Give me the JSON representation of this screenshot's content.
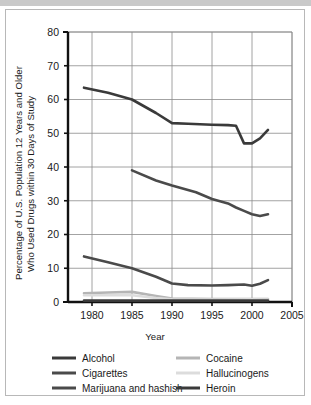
{
  "chart_data": {
    "type": "line",
    "title": "",
    "xlabel": "Year",
    "ylabel": "Percentage of U.S. Population 12 Years and Older Who Used Drugs within 30 Days of Study",
    "ylabel_line1": "Percentage of U.S. Population 12 Years and Older",
    "ylabel_line2": "Who Used Drugs within 30 Days of Study",
    "xlim": [
      1977,
      2005
    ],
    "ylim": [
      0,
      80
    ],
    "xticks": [
      1980,
      1985,
      1990,
      1995,
      2000,
      2005
    ],
    "yticks": [
      0,
      10,
      20,
      30,
      40,
      50,
      60,
      70,
      80
    ],
    "xtick_labels": [
      "1980",
      "1985",
      "1990",
      "1995",
      "2000",
      "2005"
    ],
    "ytick_labels": [
      "0",
      "10",
      "20",
      "30",
      "40",
      "50",
      "60",
      "70",
      "80"
    ],
    "grid": true,
    "legend_position": "below",
    "series": [
      {
        "name": "Alcohol",
        "color": "#3a3a3a",
        "x": [
          1979,
          1982,
          1985,
          1988,
          1990,
          1992,
          1995,
          1997,
          1998,
          1999,
          2000,
          2001,
          2002
        ],
        "values": [
          63.5,
          62.0,
          60.0,
          56.0,
          53.0,
          52.8,
          52.5,
          52.4,
          52.2,
          47.0,
          47.0,
          48.5,
          51.0
        ]
      },
      {
        "name": "Cigarettes",
        "color": "#4a4a4a",
        "x": [
          1985,
          1988,
          1990,
          1993,
          1995,
          1997,
          1998,
          1999,
          2000,
          2001,
          2002
        ],
        "values": [
          39.0,
          36.0,
          34.5,
          32.5,
          30.5,
          29.2,
          28.0,
          27.0,
          26.0,
          25.5,
          26.0
        ]
      },
      {
        "name": "Marijuana and hashish",
        "color": "#4a4a4a",
        "x": [
          1979,
          1982,
          1985,
          1988,
          1990,
          1992,
          1995,
          1997,
          1999,
          2000,
          2001,
          2002
        ],
        "values": [
          13.5,
          11.8,
          10.0,
          7.5,
          5.5,
          5.0,
          4.9,
          5.0,
          5.2,
          4.8,
          5.4,
          6.5
        ]
      },
      {
        "name": "Cocaine",
        "color": "#b5b5b5",
        "x": [
          1979,
          1982,
          1985,
          1988,
          1990,
          1995,
          2000,
          2002
        ],
        "values": [
          2.6,
          2.8,
          3.0,
          1.8,
          1.0,
          0.9,
          0.9,
          0.9
        ]
      },
      {
        "name": "Hallucinogens",
        "color": "#dcdcdc",
        "x": [
          1979,
          1982,
          1985,
          1988,
          1990,
          1995,
          2000,
          2002
        ],
        "values": [
          2.0,
          2.0,
          2.0,
          1.2,
          0.8,
          0.7,
          0.8,
          0.7
        ]
      },
      {
        "name": "Heroin",
        "color": "#3a3a3a",
        "x": [
          1979,
          1985,
          1990,
          1995,
          2000,
          2002
        ],
        "values": [
          0.4,
          0.4,
          0.4,
          0.4,
          0.4,
          0.4
        ]
      }
    ],
    "legend": [
      {
        "label": "Alcohol",
        "color": "#3a3a3a"
      },
      {
        "label": "Cigarettes",
        "color": "#4a4a4a"
      },
      {
        "label": "Marijuana and hashish",
        "color": "#4a4a4a"
      },
      {
        "label": "Cocaine",
        "color": "#b5b5b5"
      },
      {
        "label": "Hallucinogens",
        "color": "#dcdcdc"
      },
      {
        "label": "Heroin",
        "color": "#3a3a3a"
      }
    ]
  }
}
